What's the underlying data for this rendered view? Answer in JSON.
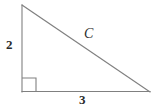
{
  "figure": {
    "kind": "right-triangle-diagram",
    "background_color": "#ffffff",
    "stroke_color": "#808080",
    "label_color": "#2b2b2b",
    "stroke_width": 1
  },
  "labels": {
    "vertical_leg": "2",
    "horizontal_leg": "3",
    "hypotenuse": "C"
  },
  "geometry": {
    "apex": {
      "x": 22,
      "y": 5
    },
    "right_angle_vertex": {
      "x": 22,
      "y": 92
    },
    "base_right_vertex": {
      "x": 150,
      "y": 92
    },
    "right_angle_marker_size": 14
  }
}
